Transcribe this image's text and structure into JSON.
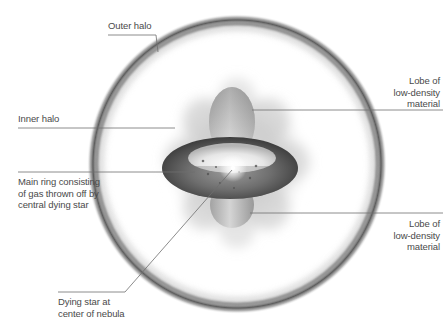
{
  "diagram": {
    "type": "planetary-nebula-structure",
    "background_color": "#ffffff",
    "line_color": "#6e6e6e",
    "text_color": "#4a4a4a",
    "components": [
      {
        "id": "outer-halo",
        "shape": "circle",
        "center": [
          237,
          164
        ],
        "radius": 140
      },
      {
        "id": "inner-halo",
        "shape": "cloud",
        "center": [
          237,
          163
        ],
        "radius": 80
      },
      {
        "id": "main-ring",
        "shape": "torus",
        "center": [
          230,
          168
        ],
        "rx": 68,
        "ry": 31
      },
      {
        "id": "upper-lobe",
        "shape": "ellipse",
        "center": [
          232,
          122
        ],
        "rx": 23,
        "ry": 35
      },
      {
        "id": "lower-lobe",
        "shape": "ellipse",
        "center": [
          232,
          205
        ],
        "rx": 22,
        "ry": 23
      },
      {
        "id": "dying-star",
        "shape": "point",
        "center": [
          233,
          168
        ]
      }
    ],
    "labels": {
      "outer_halo": "Outer halo",
      "inner_halo": "Inner halo",
      "main_ring": "Main ring consisting\nof gas thrown off by\ncentral dying star",
      "dying_star": "Dying star at\ncenter of nebula",
      "lobe_upper": "Lobe of\nlow-density\nmaterial",
      "lobe_lower": "Lobe of\nlow-density\nmaterial"
    }
  }
}
